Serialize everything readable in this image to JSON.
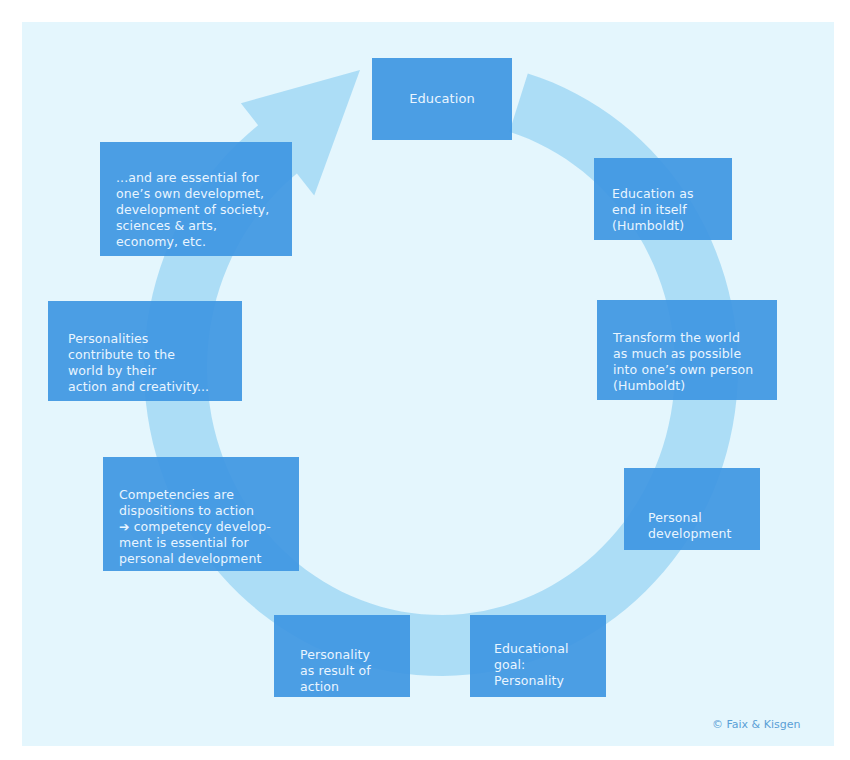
{
  "diagram": {
    "title_box": "Education",
    "nodes": [
      {
        "id": "education-end-in-itself",
        "text": "Education as\nend in itself\n(Humboldt)"
      },
      {
        "id": "transform-the-world",
        "text": "Transform the world\nas much as possible\ninto one’s own person\n(Humboldt)"
      },
      {
        "id": "personal-development",
        "text": "Personal\ndevelopment"
      },
      {
        "id": "educational-goal",
        "text": "Educational\ngoal:\nPersonality"
      },
      {
        "id": "personality-result",
        "text": "Personality\nas result of\naction"
      },
      {
        "id": "competencies",
        "text": "Competencies are\ndispositions to action\n➔ competency develop-\nment is essential for\npersonal development"
      },
      {
        "id": "personalities-contribute",
        "text": "Personalities\ncontribute to the\nworld by their\naction and creativity..."
      },
      {
        "id": "essential-for",
        "text": "...and are essential for\none’s own developmet,\ndevelopment of society,\nsciences & arts,\neconomy, etc."
      }
    ],
    "cycle_direction": "clockwise",
    "colors": {
      "background": "#e4f6fd",
      "ring": "#a9dbf5",
      "box": "#4a9fe3",
      "box_text": "#e9f5ff",
      "credit": "#5a9fd6"
    }
  },
  "credit": "© Faix & Kisgen"
}
